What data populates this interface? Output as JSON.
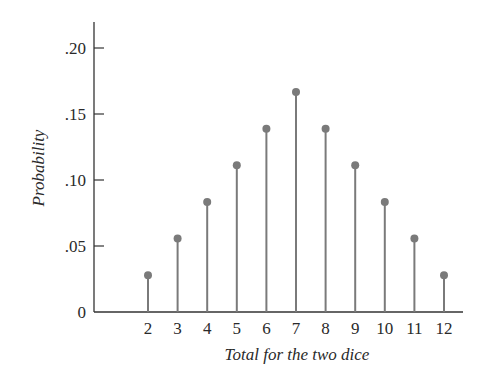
{
  "chart_data": {
    "type": "bar",
    "subtype": "stem",
    "title": "",
    "xlabel": "Total for the two dice",
    "ylabel": "Probability",
    "categories": [
      "2",
      "3",
      "4",
      "5",
      "6",
      "7",
      "8",
      "9",
      "10",
      "11",
      "12"
    ],
    "values": [
      0.0278,
      0.0556,
      0.0833,
      0.1111,
      0.1389,
      0.1667,
      0.1389,
      0.1111,
      0.0833,
      0.0556,
      0.0278
    ],
    "ylim": [
      0,
      0.22
    ],
    "yticks": [
      0,
      0.05,
      0.1,
      0.15,
      0.2
    ],
    "ytick_labels": [
      "0",
      ".05",
      ".10",
      ".15",
      ".20"
    ],
    "grid": false,
    "legend": null,
    "colors": {
      "stem": "#7a7a7a",
      "marker": "#7a7a7a",
      "axis": "#333333"
    }
  }
}
